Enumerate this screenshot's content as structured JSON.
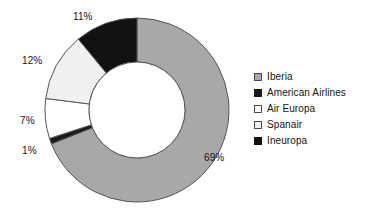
{
  "chart_data": {
    "type": "pie",
    "variant": "donut",
    "title": "",
    "subtitle": "",
    "xlabel": "",
    "ylabel": "",
    "legend_position": "right",
    "grid": false,
    "units": "%",
    "categories": [
      "Iberia",
      "American Airlines",
      "Air Europa",
      "Spanair",
      "Ineuropa"
    ],
    "values": [
      69,
      1,
      7,
      12,
      11
    ],
    "slices": [
      {
        "label": "Iberia",
        "value": 69,
        "value_label": "69%",
        "color": "#a8a8a8",
        "start_angle": 0,
        "end_angle": 248.4
      },
      {
        "label": "American Airlines",
        "value": 1,
        "value_label": "1%",
        "color": "#1a1a1a",
        "start_angle": 248.4,
        "end_angle": 252.0
      },
      {
        "label": "Air Europa",
        "value": 7,
        "value_label": "7%",
        "color": "#ffffff",
        "start_angle": 252.0,
        "end_angle": 277.2
      },
      {
        "label": "Spanair",
        "value": 12,
        "value_label": "12%",
        "color": "#f0f0f0",
        "start_angle": 277.2,
        "end_angle": 320.4
      },
      {
        "label": "Ineuropa",
        "value": 11,
        "value_label": "11%",
        "color": "#121212",
        "start_angle": 320.4,
        "end_angle": 360
      }
    ],
    "data_labels": [
      {
        "text": "11%",
        "x": 73,
        "y": 11
      },
      {
        "text": "12%",
        "x": 22,
        "y": 55
      },
      {
        "text": "7%",
        "x": 20,
        "y": 115
      },
      {
        "text": "1%",
        "x": 22,
        "y": 145
      },
      {
        "text": "69%",
        "x": 204,
        "y": 152
      }
    ]
  },
  "legend": {
    "items": [
      {
        "label": "Iberia",
        "color": "#a8a8a8",
        "border": "#4a4a4a"
      },
      {
        "label": "American Airlines",
        "color": "#1a1a1a",
        "border": "#1a1a1a"
      },
      {
        "label": "Air Europa",
        "color": "#ffffff",
        "border": "#4a4a4a"
      },
      {
        "label": "Spanair",
        "color": "#f2f2f2",
        "border": "#4a4a4a"
      },
      {
        "label": "Ineuropa",
        "color": "#121212",
        "border": "#121212"
      }
    ]
  },
  "geometry": {
    "center_x": 137,
    "center_y": 110,
    "outer_radius": 92,
    "inner_radius": 48,
    "stroke": "#555555"
  }
}
